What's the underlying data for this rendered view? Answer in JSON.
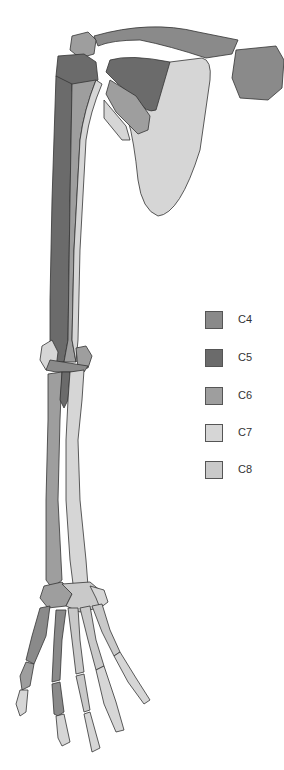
{
  "figure": {
    "colors": {
      "C4": "#8a8a8a",
      "C5": "#6b6b6b",
      "C6": "#9e9e9e",
      "C7": "#d6d6d6",
      "C8": "#c9c9c9"
    }
  },
  "legend": {
    "items": [
      {
        "label": "C4",
        "color": "#8a8a8a"
      },
      {
        "label": "C5",
        "color": "#6b6b6b"
      },
      {
        "label": "C6",
        "color": "#9e9e9e"
      },
      {
        "label": "C7",
        "color": "#d6d6d6"
      },
      {
        "label": "C8",
        "color": "#c9c9c9"
      }
    ]
  }
}
